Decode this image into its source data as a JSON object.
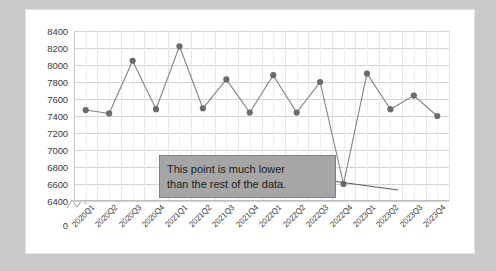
{
  "chart_data": {
    "type": "line",
    "title": "",
    "xlabel": "",
    "ylabel": "",
    "categories": [
      "2020Q1",
      "2020Q2",
      "2020Q3",
      "2020Q4",
      "2021Q1",
      "2021Q2",
      "2021Q3",
      "2021Q4",
      "2022Q1",
      "2022Q2",
      "2022Q3",
      "2022Q4",
      "2023Q1",
      "2023Q2",
      "2023Q3",
      "2023Q4"
    ],
    "values": [
      7470,
      7430,
      8050,
      7480,
      8220,
      7490,
      7830,
      7440,
      7880,
      7440,
      7800,
      6600,
      7900,
      7480,
      7640,
      7400
    ],
    "series": [
      {
        "name": "Series 1",
        "values": [
          7470,
          7430,
          8050,
          7480,
          8220,
          7490,
          7830,
          7440,
          7880,
          7440,
          7800,
          6600,
          7900,
          7480,
          7640,
          7400
        ]
      }
    ],
    "ylim": [
      6400,
      8400
    ],
    "yticks": [
      8400,
      8200,
      8000,
      7800,
      7600,
      7400,
      7200,
      7000,
      6800,
      6600,
      6400
    ],
    "ytick_labels": [
      "8400",
      "8200",
      "8000",
      "7800",
      "7600",
      "7400",
      "7200",
      "7000",
      "6800",
      "6600",
      "6400"
    ],
    "zero_label": "0",
    "axis_break": true,
    "grid": true,
    "legend": "none",
    "line_color": "#808080",
    "marker_color": "#6b6b6b",
    "gridline_color": "#d4d4d4",
    "annotations": [
      {
        "text_line_1": "This point is much lower",
        "text_line_2": "than the rest of the data.",
        "target_category": "2022Q4",
        "target_value": 6600,
        "box_fill": "#a6a6a6",
        "box_border": "#7f7f7f"
      }
    ]
  },
  "canvas": {
    "background": "#c9c9c9",
    "card_background": "#ffffff"
  }
}
